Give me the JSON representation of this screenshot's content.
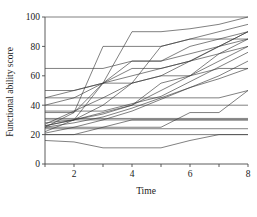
{
  "chart_data": {
    "type": "line",
    "title": "",
    "subtitle": "",
    "xlabel": "Time",
    "ylabel": "Functional ability score",
    "xlim": [
      1,
      8
    ],
    "ylim": [
      0,
      100
    ],
    "x": [
      1,
      2,
      3,
      4,
      5,
      6,
      7,
      8
    ],
    "xticks": [
      1,
      2,
      3,
      4,
      5,
      6,
      7,
      8
    ],
    "xticklabels": [
      "",
      "2",
      "",
      "4",
      "",
      "6",
      "",
      "8"
    ],
    "yticks": [
      0,
      20,
      40,
      60,
      80,
      100
    ],
    "yticklabels": [
      "0",
      "20",
      "40",
      "60",
      "80",
      "100"
    ],
    "grid": false,
    "legend": false,
    "legend_position": "none",
    "line_color": "#3c3c3c",
    "axis_color": "#4a4a4a",
    "background_color": "#ffffff",
    "annotations": [],
    "series": [
      {
        "name": "subject-01",
        "values": [
          100,
          100,
          100,
          100,
          100,
          100,
          100,
          100
        ]
      },
      {
        "name": "subject-02",
        "values": [
          65,
          65,
          65,
          70,
          70,
          75,
          80,
          85
        ]
      },
      {
        "name": "subject-03",
        "values": [
          50,
          50,
          55,
          55,
          60,
          60,
          65,
          65
        ]
      },
      {
        "name": "subject-04",
        "values": [
          45,
          50,
          55,
          65,
          65,
          70,
          75,
          80
        ]
      },
      {
        "name": "subject-05",
        "values": [
          45,
          45,
          45,
          45,
          45,
          45,
          45,
          50
        ]
      },
      {
        "name": "subject-06",
        "values": [
          40,
          45,
          55,
          60,
          65,
          70,
          80,
          90
        ]
      },
      {
        "name": "subject-07",
        "values": [
          40,
          40,
          40,
          40,
          40,
          40,
          40,
          40
        ]
      },
      {
        "name": "subject-08",
        "values": [
          36,
          36,
          36,
          41,
          46,
          56,
          66,
          76
        ]
      },
      {
        "name": "subject-09",
        "values": [
          35,
          35,
          55,
          70,
          70,
          80,
          85,
          90
        ]
      },
      {
        "name": "subject-10",
        "values": [
          31,
          31,
          31,
          31,
          31,
          31,
          31,
          31
        ]
      },
      {
        "name": "subject-11",
        "values": [
          30,
          30,
          30,
          30,
          30,
          30,
          30,
          30
        ]
      },
      {
        "name": "subject-12",
        "values": [
          28,
          30,
          35,
          40,
          55,
          60,
          70,
          80
        ]
      },
      {
        "name": "subject-13",
        "values": [
          27,
          36,
          45,
          55,
          60,
          70,
          80,
          90
        ]
      },
      {
        "name": "subject-14",
        "values": [
          26,
          30,
          34,
          40,
          50,
          60,
          75,
          85
        ]
      },
      {
        "name": "subject-15",
        "values": [
          26,
          30,
          40,
          55,
          80,
          85,
          90,
          95
        ]
      },
      {
        "name": "subject-16",
        "values": [
          25,
          35,
          80,
          80,
          80,
          85,
          85,
          85
        ]
      },
      {
        "name": "subject-17",
        "values": [
          25,
          25,
          25,
          30,
          30,
          30,
          30,
          30
        ]
      },
      {
        "name": "subject-18",
        "values": [
          25,
          28,
          32,
          38,
          45,
          52,
          58,
          65
        ]
      },
      {
        "name": "subject-19",
        "values": [
          24,
          24,
          24,
          24,
          24,
          24,
          24,
          24
        ]
      },
      {
        "name": "subject-20",
        "values": [
          22,
          30,
          55,
          90,
          90,
          92,
          95,
          100
        ]
      },
      {
        "name": "subject-21",
        "values": [
          21,
          25,
          30,
          36,
          44,
          52,
          60,
          70
        ]
      },
      {
        "name": "subject-22",
        "values": [
          20,
          20,
          25,
          25,
          25,
          35,
          35,
          50
        ]
      },
      {
        "name": "subject-23",
        "values": [
          20,
          20,
          20,
          20,
          20,
          20,
          20,
          20
        ]
      },
      {
        "name": "subject-24",
        "values": [
          16,
          15,
          11,
          11,
          11,
          16,
          20,
          20
        ]
      }
    ]
  }
}
